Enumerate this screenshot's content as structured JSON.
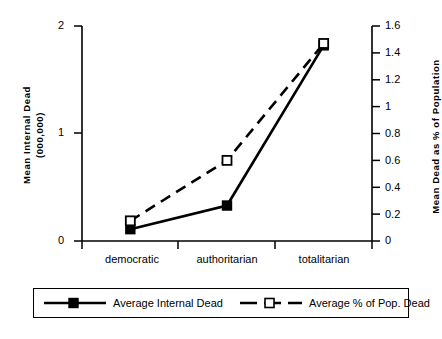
{
  "chart_data": {
    "type": "line",
    "title": "",
    "categories": [
      "democratic",
      "authoritarian",
      "totalitarian"
    ],
    "xlabel": "",
    "series": [
      {
        "name": "Average Internal Dead",
        "axis": "left",
        "marker": "filled-square",
        "line_style": "solid",
        "color": "#000000",
        "values": [
          0.11,
          0.33,
          1.82
        ]
      },
      {
        "name": "Average % of Pop. Dead",
        "axis": "right",
        "marker": "open-square",
        "line_style": "dashed",
        "color": "#000000",
        "values": [
          0.15,
          0.6,
          1.47
        ]
      }
    ],
    "y_left": {
      "label": "Mean Internal Dead\n(000,000)",
      "ticks": [
        "0",
        "1",
        "2"
      ],
      "tick_values": [
        0,
        1,
        2
      ],
      "ylim": [
        0,
        2
      ]
    },
    "y_right": {
      "label": "Mean Dead as % of Population",
      "ticks": [
        "0",
        "0.2",
        "0.4",
        "0.6",
        "0.8",
        "1",
        "1.2",
        "1.4",
        "1.6"
      ],
      "tick_values": [
        0,
        0.2,
        0.4,
        0.6,
        0.8,
        1,
        1.2,
        1.4,
        1.6
      ],
      "ylim": [
        0,
        1.6
      ]
    },
    "grid": false,
    "legend_position": "bottom",
    "legend": [
      {
        "label": "Average Internal Dead"
      },
      {
        "label": "Average % of Pop. Dead"
      }
    ]
  }
}
